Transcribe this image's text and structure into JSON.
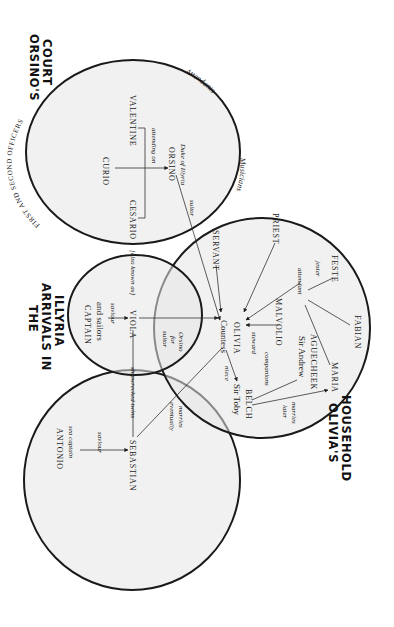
{
  "groups": {
    "orsinos_court": {
      "title_line1": "ORSINO'S",
      "title_line2": "COURT"
    },
    "arrivals": {
      "title_line1": "THE",
      "title_line2": "ARRIVALS IN",
      "title_line3": "ILLYRIA"
    },
    "olivias_household": {
      "title_line1": "OLIVIA'S",
      "title_line2": "HOUSEHOLD"
    }
  },
  "arc_labels": {
    "officers": "FIRST AND SECOND OFFICERS",
    "attendants": "Attendants",
    "musicians": "Musicians"
  },
  "characters": {
    "valentine": "VALENTINE",
    "curio": "CURIO",
    "cesario": "CESARIO",
    "orsino": "ORSINO",
    "orsino_desc": "Duke of Illyria",
    "captain": "CAPTAIN",
    "captain_desc": "and sailors",
    "viola": "VIOLA",
    "countess": "Countess",
    "olivia": "OLIVIA",
    "servant": "SERVANT",
    "priest": "PRIEST",
    "feste": "FESTE",
    "malvolio": "MALVOLIO",
    "fabian": "FABIAN",
    "sir_andrew": "Sir Andrew",
    "aguecheek": "AGUECHEEK",
    "maria": "MARIA",
    "sir_toby": "Sir Toby",
    "belch": "BELCH",
    "antonio": "ANTONIO",
    "antonio_desc": "sea captain",
    "sebastian": "SEBASTIAN"
  },
  "relations": {
    "attending_on": "attending on",
    "suitor": "suitor",
    "saviour_viola": "saviour",
    "also_known_as": "[also known as]",
    "suitor_for_orsino_1": "suitor",
    "suitor_for_orsino_2": "for",
    "suitor_for_orsino_3": "Orsino",
    "steward": "steward",
    "attendant": "attendant",
    "jester": "jester",
    "niece": "niece",
    "companions": "companions",
    "later_marries_1": "later",
    "later_marries_2": "marries",
    "shipwrecked_twins": "shipwrecked twins",
    "eventually_marries_1": "eventually",
    "eventually_marries_2": "marries",
    "saviour_sebastian": "saviour"
  },
  "colors": {
    "circle_fill": "#e6e6e6",
    "stroke": "#1a1a1a",
    "background": "#ffffff"
  }
}
